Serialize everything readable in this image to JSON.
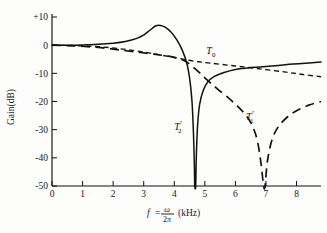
{
  "chart_data": {
    "type": "line",
    "title": "",
    "xlabel": "f = ω/2π (kHz)",
    "ylabel": "Gain(dB)",
    "xlim": [
      0,
      8.8
    ],
    "ylim": [
      -50,
      10
    ],
    "xticks": [
      0,
      1,
      2,
      3,
      4,
      5,
      6,
      7,
      8
    ],
    "xtick_labels": [
      "0",
      "1",
      "2",
      "3",
      "4",
      "5",
      "6",
      "7",
      "8"
    ],
    "yticks": [
      10,
      0,
      -10,
      -20,
      -30,
      -40,
      -50
    ],
    "ytick_labels": [
      "+10",
      "0",
      "-10",
      "-20",
      "-30",
      "-40",
      "-50"
    ],
    "grid": false,
    "legend": "inline-annotations",
    "series": [
      {
        "name": "T2'",
        "label": "T",
        "subscript": "2",
        "prime": "′",
        "style": "solid",
        "color": "#111111",
        "notch_frequency_khz": 4.67,
        "peak_gain_db": 7.0,
        "peak_frequency_khz": 3.42,
        "plateau_gain_db": -8.0,
        "right_edge_gain_db": -6.0,
        "points": [
          [
            0.0,
            0.0
          ],
          [
            0.5,
            0.0
          ],
          [
            1.0,
            0.1
          ],
          [
            1.5,
            0.3
          ],
          [
            2.0,
            0.7
          ],
          [
            2.4,
            1.3
          ],
          [
            2.8,
            2.5
          ],
          [
            3.0,
            3.6
          ],
          [
            3.2,
            5.3
          ],
          [
            3.4,
            6.9
          ],
          [
            3.55,
            7.0
          ],
          [
            3.7,
            6.4
          ],
          [
            3.9,
            4.6
          ],
          [
            4.1,
            1.6
          ],
          [
            4.25,
            -1.5
          ],
          [
            4.4,
            -6.0
          ],
          [
            4.5,
            -11.5
          ],
          [
            4.58,
            -20.0
          ],
          [
            4.63,
            -32.0
          ],
          [
            4.66,
            -44.0
          ],
          [
            4.67,
            -50.0
          ],
          [
            4.7,
            -50.0
          ],
          [
            4.72,
            -40.0
          ],
          [
            4.76,
            -29.0
          ],
          [
            4.83,
            -21.0
          ],
          [
            4.95,
            -16.0
          ],
          [
            5.1,
            -13.0
          ],
          [
            5.3,
            -11.2
          ],
          [
            5.6,
            -9.8
          ],
          [
            6.0,
            -8.6
          ],
          [
            6.4,
            -8.1
          ],
          [
            6.9,
            -7.7
          ],
          [
            7.4,
            -7.2
          ],
          [
            7.9,
            -6.7
          ],
          [
            8.4,
            -6.3
          ],
          [
            8.8,
            -6.0
          ]
        ]
      },
      {
        "name": "T0",
        "label": "T",
        "subscript": "0",
        "prime": "",
        "style": "dashed-short",
        "color": "#111111",
        "right_edge_gain_db": -11.2,
        "points": [
          [
            0.0,
            0.0
          ],
          [
            0.8,
            -0.2
          ],
          [
            1.6,
            -0.6
          ],
          [
            2.4,
            -1.5
          ],
          [
            3.2,
            -2.8
          ],
          [
            4.0,
            -4.4
          ],
          [
            4.6,
            -5.6
          ],
          [
            5.2,
            -6.4
          ],
          [
            6.0,
            -7.4
          ],
          [
            6.8,
            -8.4
          ],
          [
            7.6,
            -9.5
          ],
          [
            8.2,
            -10.4
          ],
          [
            8.8,
            -11.2
          ]
        ]
      },
      {
        "name": "T1'",
        "label": "T",
        "subscript": "1",
        "prime": "′",
        "style": "dashed-long",
        "color": "#111111",
        "notch_frequency_khz": 6.93,
        "right_edge_gain_db": -20.0,
        "points": [
          [
            0.0,
            0.0
          ],
          [
            0.8,
            -0.3
          ],
          [
            1.6,
            -0.9
          ],
          [
            2.3,
            -1.8
          ],
          [
            2.9,
            -2.6
          ],
          [
            3.4,
            -3.3
          ],
          [
            3.8,
            -3.9
          ],
          [
            4.1,
            -4.6
          ],
          [
            4.35,
            -5.6
          ],
          [
            4.6,
            -7.6
          ],
          [
            4.85,
            -10.0
          ],
          [
            5.1,
            -12.6
          ],
          [
            5.4,
            -15.4
          ],
          [
            5.8,
            -19.0
          ],
          [
            6.1,
            -22.0
          ],
          [
            6.35,
            -25.0
          ],
          [
            6.55,
            -28.5
          ],
          [
            6.72,
            -34.0
          ],
          [
            6.85,
            -43.0
          ],
          [
            6.92,
            -50.0
          ],
          [
            6.97,
            -50.0
          ],
          [
            7.05,
            -41.0
          ],
          [
            7.2,
            -33.5
          ],
          [
            7.4,
            -29.0
          ],
          [
            7.7,
            -25.5
          ],
          [
            8.0,
            -23.3
          ],
          [
            8.4,
            -21.3
          ],
          [
            8.8,
            -20.0
          ]
        ]
      }
    ],
    "annotations": [
      {
        "text": "T0",
        "x_khz": 5.05,
        "y_db": -3.2
      },
      {
        "text": "T2'",
        "x_khz": 4.0,
        "y_db": -30.0
      },
      {
        "text": "T1'",
        "x_khz": 6.35,
        "y_db": -26.5
      }
    ]
  },
  "axes": {
    "y_axis_title": "Gain(dB)",
    "x_axis_title_parts": {
      "variable": "f",
      "equals": "=",
      "numerator": "ω",
      "denominator": "2π",
      "unit": "(kHz)"
    }
  }
}
